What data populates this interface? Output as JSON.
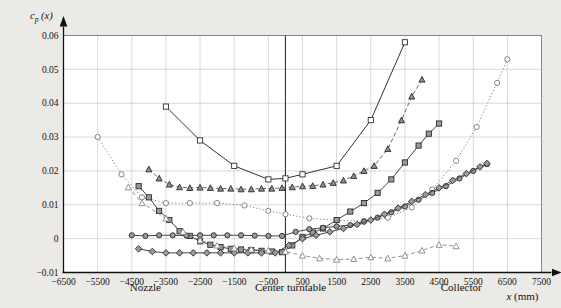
{
  "chart_data": {
    "type": "line",
    "title": "",
    "subtitle": "",
    "xlabel": "x (mm)",
    "ylabel": "c_p (x)",
    "ylabel_parts": {
      "base": "c",
      "sub": "p",
      "arg": "(x)"
    },
    "xlim": [
      -6500,
      7500
    ],
    "ylim": [
      -0.01,
      0.06
    ],
    "xticks": [
      -6500,
      -5500,
      -4500,
      -3500,
      -2500,
      -1500,
      -500,
      500,
      1500,
      2500,
      3500,
      4500,
      5500,
      6500,
      7500
    ],
    "xticklabels": [
      "−6500",
      "−5500",
      "−4500",
      "−3500",
      "−2500",
      "−1500",
      "−500",
      "500",
      "1500",
      "2500",
      "3500",
      "4500",
      "5500",
      "6500",
      "7500"
    ],
    "yticks": [
      -0.01,
      0,
      0.01,
      0.02,
      0.03,
      0.04,
      0.05,
      0.06
    ],
    "yticklabels": [
      "−0.01",
      "0",
      "0.01",
      "0.02",
      "0.03",
      "0.04",
      "0.05",
      "0.06"
    ],
    "grid": true,
    "grid_color": "#c9c9c9",
    "legend": "none",
    "annotations": [
      {
        "text": "Nozzle",
        "x": -4100,
        "y": -0.0155
      },
      {
        "text": "Center turntable",
        "x": 150,
        "y": -0.0155
      },
      {
        "text": "Collector",
        "x": 5150,
        "y": -0.0155
      }
    ],
    "vertical_reference_line": {
      "x": 0,
      "label": "Center turntable",
      "color": "#333333"
    },
    "series": [
      {
        "name": "open-square-solid",
        "marker": "square-open",
        "linestyle": "solid",
        "color": "#333333",
        "x": [
          -3500,
          -2500,
          -1500,
          -500,
          0,
          500,
          1500,
          2500,
          3500
        ],
        "y": [
          0.039,
          0.029,
          0.0215,
          0.0175,
          0.0178,
          0.019,
          0.0215,
          0.035,
          0.058
        ]
      },
      {
        "name": "shaded-triangle-dashed",
        "marker": "triangle-shaded",
        "linestyle": "dashed",
        "color": "#555555",
        "x": [
          -4000,
          -3700,
          -3400,
          -3100,
          -2800,
          -2500,
          -2200,
          -1900,
          -1600,
          -1300,
          -1000,
          -700,
          -400,
          -100,
          200,
          500,
          800,
          1100,
          1400,
          1700,
          2000,
          2300,
          2600,
          3000,
          3400,
          3700,
          4000
        ],
        "y": [
          0.0205,
          0.0178,
          0.016,
          0.0152,
          0.015,
          0.0151,
          0.015,
          0.0148,
          0.0148,
          0.0146,
          0.0146,
          0.0148,
          0.0148,
          0.015,
          0.0152,
          0.0155,
          0.0156,
          0.016,
          0.0165,
          0.0172,
          0.0185,
          0.02,
          0.0215,
          0.0265,
          0.035,
          0.042,
          0.047
        ]
      },
      {
        "name": "open-circle-dotted",
        "marker": "circle-open",
        "linestyle": "dotted",
        "color": "#777777",
        "x": [
          -5500,
          -4800,
          -4200,
          -3500,
          -2800,
          -2000,
          -1200,
          -500,
          0,
          700,
          1500,
          2300,
          3000,
          3700,
          4300,
          5000,
          5600,
          6200,
          6500
        ],
        "y": [
          0.03,
          0.019,
          0.0122,
          0.0105,
          0.0105,
          0.0105,
          0.0098,
          0.0082,
          0.0072,
          0.006,
          0.0054,
          0.0052,
          0.0062,
          0.0092,
          0.0145,
          0.023,
          0.033,
          0.046,
          0.053
        ]
      },
      {
        "name": "shaded-square-solid",
        "marker": "square-shaded",
        "linestyle": "solid",
        "color": "#444444",
        "x": [
          -4300,
          -4000,
          -3700,
          -3400,
          -3100,
          -2800,
          -2500,
          -2200,
          -1900,
          -1600,
          -1300,
          -1000,
          -700,
          -400,
          -100,
          200,
          500,
          800,
          1100,
          1500,
          1900,
          2300,
          2700,
          3100,
          3500,
          3900,
          4200,
          4500
        ],
        "y": [
          0.0155,
          0.0122,
          0.0082,
          0.0055,
          0.0022,
          0.0008,
          -0.0008,
          -0.0018,
          -0.0025,
          -0.003,
          -0.0032,
          -0.0034,
          -0.0036,
          -0.0038,
          -0.004,
          -0.002,
          0.0005,
          0.0018,
          0.003,
          0.0055,
          0.008,
          0.0105,
          0.0135,
          0.0175,
          0.0225,
          0.0275,
          0.031,
          0.034
        ]
      },
      {
        "name": "shaded-circle-solid",
        "marker": "circle-shaded",
        "linestyle": "solid",
        "color": "#444444",
        "x": [
          -4500,
          -4100,
          -3700,
          -3300,
          -2900,
          -2500,
          -2100,
          -1700,
          -1300,
          -900,
          -500,
          -100,
          300,
          700,
          1100,
          1500,
          1900,
          2300,
          2700,
          3100,
          3500,
          3900,
          4300,
          4700,
          5100,
          5500,
          5900
        ],
        "y": [
          0.001,
          0.0008,
          0.001,
          0.001,
          0.0009,
          0.001,
          0.001,
          0.001,
          0.001,
          0.0009,
          0.0008,
          0.0008,
          0.002,
          0.0028,
          0.0032,
          0.0036,
          0.004,
          0.005,
          0.0062,
          0.0078,
          0.0095,
          0.0115,
          0.0135,
          0.0155,
          0.0178,
          0.02,
          0.022
        ]
      },
      {
        "name": "shaded-diamond-solid",
        "marker": "diamond-shaded",
        "linestyle": "solid",
        "color": "#444444",
        "x": [
          -4300,
          -3900,
          -3500,
          -3100,
          -2700,
          -2300,
          -1900,
          -1500,
          -1100,
          -700,
          -300,
          100,
          500,
          900,
          1300,
          1700,
          2100,
          2500,
          2900,
          3300,
          3700,
          4100,
          4500,
          4900,
          5300,
          5700,
          5900
        ],
        "y": [
          -0.003,
          -0.0038,
          -0.0042,
          -0.0042,
          -0.0042,
          -0.0042,
          -0.0042,
          -0.0042,
          -0.0042,
          -0.0042,
          -0.0042,
          -0.002,
          0.0,
          0.001,
          0.002,
          0.003,
          0.0042,
          0.0055,
          0.0072,
          0.009,
          0.011,
          0.013,
          0.015,
          0.0172,
          0.0192,
          0.0212,
          0.0222
        ]
      },
      {
        "name": "open-triangle-dashed-low",
        "marker": "triangle-open",
        "linestyle": "dashed",
        "color": "#888888",
        "x": [
          -4600,
          -4200,
          -3500,
          -3000,
          -2500,
          -2000,
          -1500,
          -1000,
          -500,
          0,
          500,
          1000,
          1500,
          2000,
          2500,
          3000,
          3500,
          4000,
          4500,
          5000
        ],
        "y": [
          0.0152,
          0.0105,
          0.006,
          0.002,
          -0.0005,
          -0.002,
          -0.0028,
          -0.0032,
          -0.0035,
          -0.0038,
          -0.005,
          -0.0058,
          -0.0062,
          -0.006,
          -0.0055,
          -0.0058,
          -0.005,
          -0.0035,
          -0.0018,
          -0.0022
        ]
      }
    ]
  }
}
